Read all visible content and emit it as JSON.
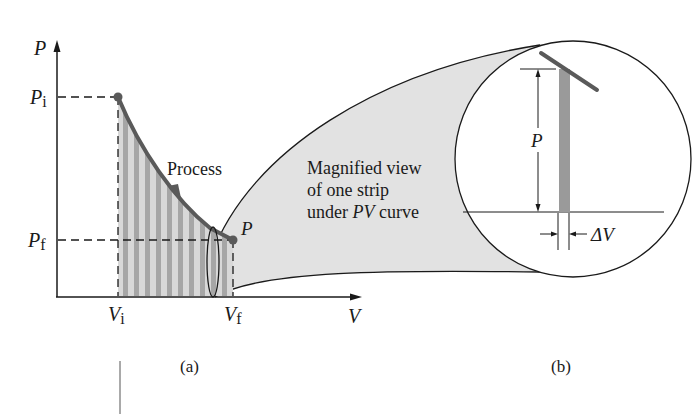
{
  "figure": {
    "panel_a": {
      "caption": "(a)",
      "y_axis_label": "P",
      "x_axis_label": "V",
      "p_initial": {
        "main": "P",
        "sub": "i"
      },
      "p_final": {
        "main": "P",
        "sub": "f"
      },
      "v_initial": {
        "main": "V",
        "sub": "i"
      },
      "v_final": {
        "main": "V",
        "sub": "f"
      },
      "process_label": "Process",
      "endpoint_label": "P"
    },
    "panel_b": {
      "caption": "(b)",
      "magnified_text": [
        "Magnified view",
        "of one strip"
      ],
      "magnified_text_line3_prefix": "under ",
      "magnified_text_line3_italic": "PV",
      "magnified_text_line3_suffix": " curve",
      "strip_height_label": "P",
      "strip_width_label": "ΔV"
    },
    "colors": {
      "curve": "#5a5a5a",
      "strip": "#9a9a9a",
      "stripe_light": "#d6d6d6",
      "cone_fill": "#e2e2e2",
      "line": "#1a1a1a"
    }
  }
}
